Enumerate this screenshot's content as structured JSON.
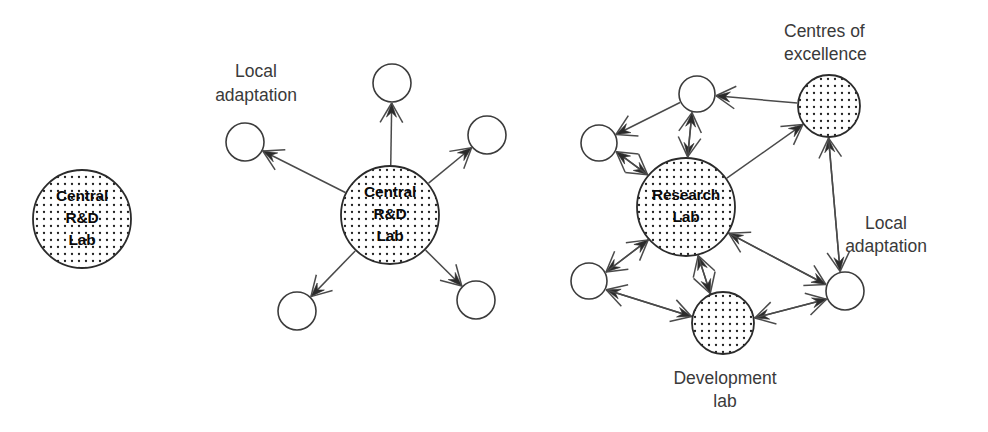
{
  "figure": {
    "type": "diagram",
    "title": "",
    "background_color": "#ffffff",
    "stroke_color": "#3c3c3c",
    "text_color": "#3a3a3a",
    "node_text_color": "#0a0a0a"
  },
  "panels": [
    {
      "id": "panel-1",
      "name": "central-rd-lab-only",
      "nodes": [
        {
          "id": "p1-central",
          "label_lines": [
            "Central",
            "R&D",
            "Lab"
          ],
          "style": "dotted-fill",
          "cx": 82,
          "cy": 219,
          "r": 49
        }
      ],
      "captions": [],
      "edges": []
    },
    {
      "id": "panel-2",
      "name": "central-rd-lab-with-local-adaptation",
      "nodes": [
        {
          "id": "p2-central",
          "label_lines": [
            "Central",
            "R&D",
            "Lab"
          ],
          "style": "dotted-fill",
          "cx": 390,
          "cy": 215,
          "r": 49
        },
        {
          "id": "p2-top",
          "label_lines": [],
          "style": "outline",
          "cx": 392,
          "cy": 83,
          "r": 19
        },
        {
          "id": "p2-left",
          "label_lines": [],
          "style": "outline",
          "cx": 245,
          "cy": 142,
          "r": 19
        },
        {
          "id": "p2-right",
          "label_lines": [],
          "style": "outline",
          "cx": 487,
          "cy": 135,
          "r": 19
        },
        {
          "id": "p2-bl",
          "label_lines": [],
          "style": "outline",
          "cx": 297,
          "cy": 311,
          "r": 19
        },
        {
          "id": "p2-br",
          "label_lines": [],
          "style": "outline",
          "cx": 476,
          "cy": 300,
          "r": 19
        }
      ],
      "captions": [
        {
          "id": "p2-caption-local",
          "text_lines": [
            "Local",
            "adaptation"
          ],
          "x": 256,
          "y": 72,
          "line_height": 24,
          "align": "center"
        }
      ],
      "edges": [
        {
          "from": "p2-central",
          "to": "p2-top",
          "arrow": "to"
        },
        {
          "from": "p2-central",
          "to": "p2-left",
          "arrow": "to"
        },
        {
          "from": "p2-central",
          "to": "p2-right",
          "arrow": "to"
        },
        {
          "from": "p2-central",
          "to": "p2-bl",
          "arrow": "to"
        },
        {
          "from": "p2-central",
          "to": "p2-br",
          "arrow": "to"
        }
      ]
    },
    {
      "id": "panel-3",
      "name": "research-lab-network",
      "nodes": [
        {
          "id": "p3-research",
          "label_lines": [
            "Research",
            "Lab"
          ],
          "style": "dotted-fill",
          "cx": 686,
          "cy": 207,
          "r": 49
        },
        {
          "id": "p3-centres",
          "label_lines": [],
          "style": "dotted-fill",
          "cx": 829,
          "cy": 106,
          "r": 31
        },
        {
          "id": "p3-devlab",
          "label_lines": [],
          "style": "dotted-fill",
          "cx": 723,
          "cy": 323,
          "r": 31
        },
        {
          "id": "p3-top",
          "label_lines": [],
          "style": "outline",
          "cx": 697,
          "cy": 94,
          "r": 18
        },
        {
          "id": "p3-lu",
          "label_lines": [],
          "style": "outline",
          "cx": 599,
          "cy": 143,
          "r": 18
        },
        {
          "id": "p3-ll",
          "label_lines": [],
          "style": "outline",
          "cx": 589,
          "cy": 281,
          "r": 18
        },
        {
          "id": "p3-right",
          "label_lines": [],
          "style": "outline",
          "cx": 845,
          "cy": 291,
          "r": 19
        }
      ],
      "captions": [
        {
          "id": "p3-caption-centres",
          "text_lines": [
            "Centres of",
            "excellence"
          ],
          "x": 784,
          "y": 32,
          "line_height": 23,
          "align": "left"
        },
        {
          "id": "p3-caption-local",
          "text_lines": [
            "Local",
            "adaptation"
          ],
          "x": 886,
          "y": 224,
          "line_height": 23,
          "align": "center"
        },
        {
          "id": "p3-caption-devlab",
          "text_lines": [
            "Development",
            "lab"
          ],
          "x": 725,
          "y": 379,
          "line_height": 23,
          "align": "center"
        }
      ],
      "edges": [
        {
          "from": "p3-top",
          "to": "p3-research",
          "arrow": "to"
        },
        {
          "from": "p3-research",
          "to": "p3-top",
          "arrow": "to"
        },
        {
          "from": "p3-top",
          "to": "p3-lu",
          "arrow": "to"
        },
        {
          "from": "p3-centres",
          "to": "p3-top",
          "arrow": "to"
        },
        {
          "from": "p3-research",
          "to": "p3-centres",
          "arrow": "to"
        },
        {
          "from": "p3-lu",
          "to": "p3-research",
          "arrow": "to"
        },
        {
          "from": "p3-research",
          "to": "p3-lu",
          "arrow": "to"
        },
        {
          "from": "p3-research",
          "to": "p3-ll",
          "arrow": "to"
        },
        {
          "from": "p3-ll",
          "to": "p3-research",
          "arrow": "to"
        },
        {
          "from": "p3-right",
          "to": "p3-centres",
          "arrow": "to"
        },
        {
          "from": "p3-centres",
          "to": "p3-right",
          "arrow": "to"
        },
        {
          "from": "p3-right",
          "to": "p3-research",
          "arrow": "to"
        },
        {
          "from": "p3-research",
          "to": "p3-right",
          "arrow": "to"
        },
        {
          "from": "p3-devlab",
          "to": "p3-research",
          "arrow": "to"
        },
        {
          "from": "p3-research",
          "to": "p3-devlab",
          "arrow": "to"
        },
        {
          "from": "p3-devlab",
          "to": "p3-ll",
          "arrow": "to"
        },
        {
          "from": "p3-ll",
          "to": "p3-devlab",
          "arrow": "to"
        },
        {
          "from": "p3-right",
          "to": "p3-devlab",
          "arrow": "to"
        },
        {
          "from": "p3-devlab",
          "to": "p3-right",
          "arrow": "to"
        }
      ]
    }
  ]
}
